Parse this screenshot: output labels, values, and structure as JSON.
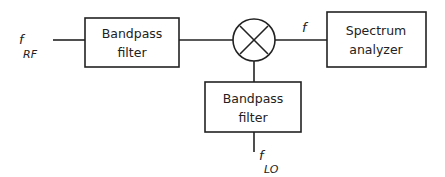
{
  "diagram": {
    "type": "block-diagram",
    "blocks": {
      "rf_filter": {
        "line1": "Bandpass",
        "line2": "filter"
      },
      "lo_filter": {
        "line1": "Bandpass",
        "line2": "filter"
      },
      "spectrum_analyzer": {
        "line1": "Spectrum",
        "line2": "analyzer"
      },
      "mixer": {
        "symbol": "×"
      }
    },
    "labels": {
      "rf_input": {
        "base": "f",
        "subscript": "RF"
      },
      "output": {
        "base": "f"
      },
      "lo_input": {
        "base": "f",
        "subscript": "LO"
      }
    },
    "connections": [
      {
        "from": "rf_input",
        "to": "rf_filter"
      },
      {
        "from": "rf_filter",
        "to": "mixer"
      },
      {
        "from": "mixer",
        "to": "spectrum_analyzer",
        "label": "f"
      },
      {
        "from": "lo_input",
        "to": "lo_filter"
      },
      {
        "from": "lo_filter",
        "to": "mixer"
      }
    ]
  }
}
